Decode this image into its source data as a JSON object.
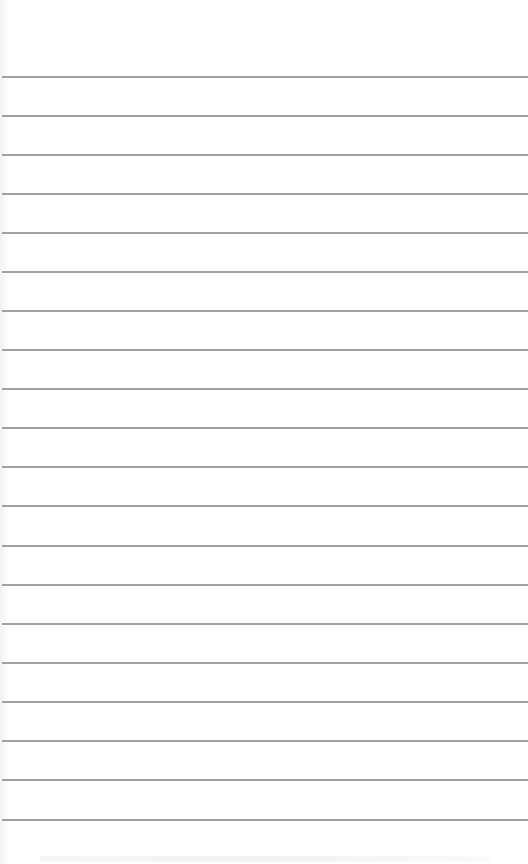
{
  "page": {
    "type": "ruled-notebook-page",
    "background_color": "#ffffff",
    "line_color": "#8f8f8f",
    "line_count": 20,
    "line_spacing_px": 39,
    "first_line_y": 77,
    "lines_y": [
      77,
      116,
      155,
      194,
      233,
      272,
      311,
      350,
      389,
      428,
      467,
      506,
      546,
      585,
      624,
      663,
      702,
      741,
      780,
      820
    ],
    "text": ""
  }
}
